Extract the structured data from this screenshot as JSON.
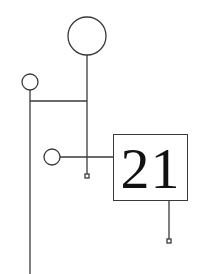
{
  "diagram": {
    "type": "tree-schematic",
    "stroke_color": "#3a3a3a",
    "background": "#ffffff",
    "box": {
      "label": "21"
    },
    "nodes": [
      {
        "id": "large-circle",
        "shape": "circle",
        "cx": 87,
        "cy": 36,
        "r": 19
      },
      {
        "id": "small-circle-top-left",
        "shape": "circle",
        "cx": 30,
        "cy": 82,
        "r": 8
      },
      {
        "id": "small-circle-middle",
        "shape": "circle",
        "cx": 52,
        "cy": 157,
        "r": 8
      },
      {
        "id": "terminal-square-1",
        "shape": "square",
        "cx": 87,
        "cy": 176,
        "size": 4
      },
      {
        "id": "terminal-square-2",
        "shape": "square",
        "cx": 169,
        "cy": 241,
        "size": 4
      },
      {
        "id": "number-box",
        "shape": "rect",
        "x": 113,
        "y": 134,
        "w": 75,
        "h": 67
      }
    ]
  }
}
